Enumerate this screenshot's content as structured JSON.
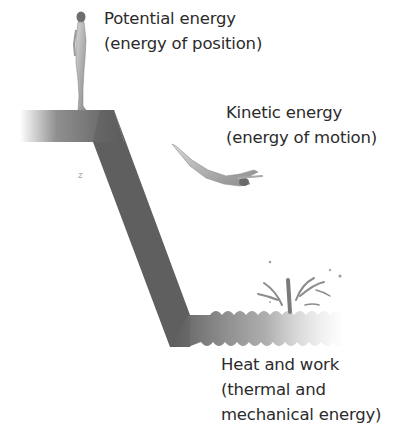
{
  "diagram": {
    "stages": [
      {
        "id": "potential",
        "line1": "Potential energy",
        "line2": "(energy of position)",
        "icon": "standing-diver-icon"
      },
      {
        "id": "kinetic",
        "line1": "Kinetic energy",
        "line2": "(energy of motion)",
        "icon": "diving-figure-icon"
      },
      {
        "id": "heat",
        "line1": "Heat and work",
        "line2": "(thermal and",
        "line3": "mechanical energy)",
        "icon": "water-splash-icon"
      }
    ],
    "colors": {
      "platform": "#5e5e5e",
      "water": "#7a7a7a",
      "text": "#2b2b2b",
      "background": "#ffffff"
    }
  }
}
